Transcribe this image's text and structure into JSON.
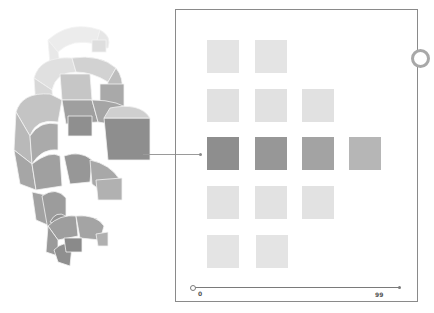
{
  "diagram": {
    "helix_description": "Stacked spiral of grey 3D segmented arcs",
    "grid": {
      "rows": [
        {
          "count": 2,
          "color": "#e4e4e4"
        },
        {
          "count": 3,
          "color": "#e0e0e0"
        },
        {
          "count": 4,
          "colors": [
            "#8e8e8e",
            "#979797",
            "#a3a3a3",
            "#b6b6b6"
          ]
        },
        {
          "count": 3,
          "color": "#e2e2e2"
        },
        {
          "count": 2,
          "color": "#e4e4e4"
        }
      ]
    },
    "axis": {
      "start_label": "0",
      "end_label": "99"
    },
    "colors": {
      "frame": "#8a8a8a",
      "highlight": "#8e8e8e",
      "light": "#e3e3e3"
    }
  }
}
